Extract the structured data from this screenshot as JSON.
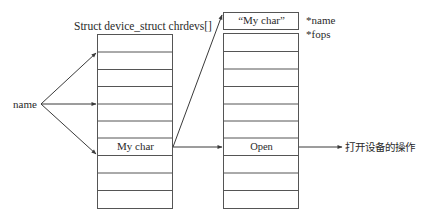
{
  "diagram": {
    "left_table": {
      "title": "Struct device_struct chrdevs[]",
      "row_count": 10,
      "highlight_row_index": 6,
      "highlight_row_label": "My char"
    },
    "input_label": "name",
    "right_struct": {
      "name_box_label": "“My char”",
      "field_labels": [
        "*name",
        "*fops"
      ],
      "ops_table_row_count": 10,
      "ops_highlight_row_index": 6,
      "ops_highlight_row_label": "Open"
    },
    "output_label": "打开设备的操作",
    "colors": {
      "line": "#3a3a3a",
      "text": "#2a2a2a",
      "background": "#ffffff"
    }
  }
}
